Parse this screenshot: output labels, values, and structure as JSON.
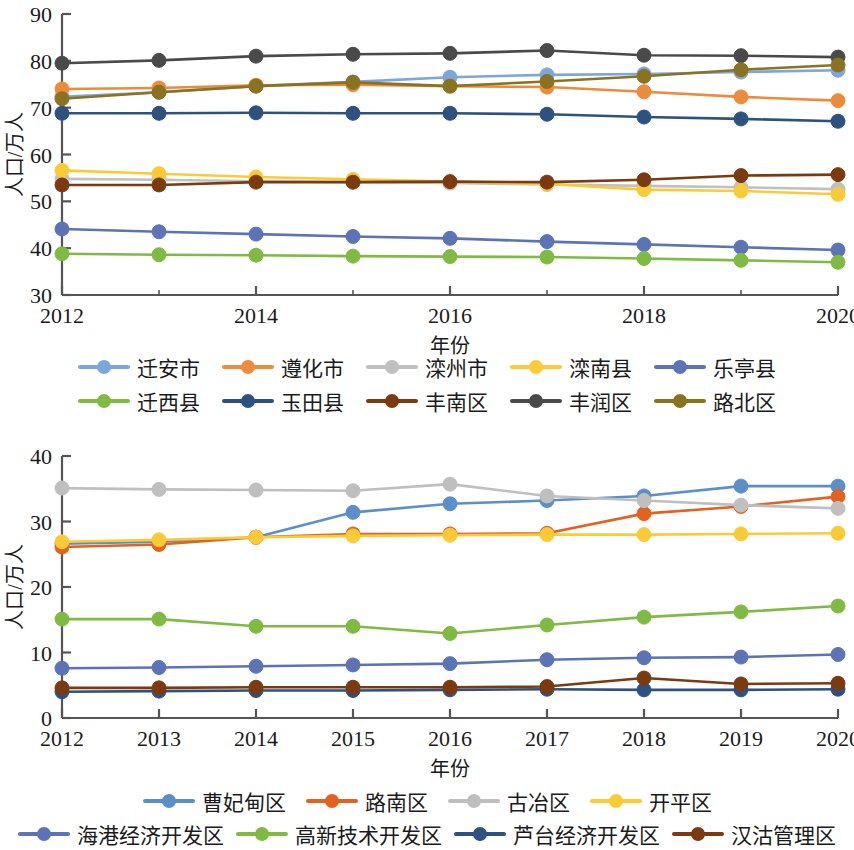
{
  "axis_common": {
    "ylabel": "人口/万人",
    "xlabel": "年份"
  },
  "chart_data": [
    {
      "id": "top",
      "type": "line",
      "title": "",
      "xlabel": "年份",
      "ylabel": "人口/万人",
      "x": [
        2012,
        2013,
        2014,
        2015,
        2016,
        2017,
        2018,
        2019,
        2020
      ],
      "xtick_labels": [
        "2012",
        "2014",
        "2016",
        "2018",
        "2020"
      ],
      "xtick_values": [
        2012,
        2014,
        2016,
        2018,
        2020
      ],
      "ytick_labels": [
        "30",
        "40",
        "50",
        "60",
        "70",
        "80",
        "90"
      ],
      "ylim": [
        30,
        90
      ],
      "xlim": [
        2012,
        2020
      ],
      "grid": false,
      "legend_position": "below",
      "series": [
        {
          "name": "迁安市",
          "color": "#7BA7DC",
          "values": [
            72.3,
            73.3,
            74.6,
            75.5,
            76.5,
            77.0,
            77.2,
            77.6,
            78.0
          ]
        },
        {
          "name": "遵化市",
          "color": "#ED8B3C",
          "values": [
            74.0,
            74.2,
            74.8,
            74.9,
            74.6,
            74.4,
            73.4,
            72.3,
            71.5
          ]
        },
        {
          "name": "滦州市",
          "color": "#C0C0C0",
          "values": [
            54.8,
            54.6,
            54.3,
            54.1,
            53.9,
            53.6,
            53.3,
            53.0,
            52.6
          ]
        },
        {
          "name": "滦南县",
          "color": "#FBCB37",
          "values": [
            56.6,
            55.9,
            55.2,
            54.7,
            54.2,
            53.7,
            52.5,
            52.2,
            51.5
          ]
        },
        {
          "name": "乐亭县",
          "color": "#5C74B5",
          "values": [
            44.1,
            43.5,
            43.0,
            42.5,
            42.1,
            41.4,
            40.8,
            40.2,
            39.6
          ]
        },
        {
          "name": "迁西县",
          "color": "#7FBB42",
          "values": [
            38.8,
            38.6,
            38.5,
            38.3,
            38.2,
            38.1,
            37.8,
            37.4,
            37.0
          ]
        },
        {
          "name": "玉田县",
          "color": "#2E5280",
          "values": [
            68.8,
            68.8,
            68.9,
            68.8,
            68.8,
            68.6,
            68.0,
            67.6,
            67.1
          ]
        },
        {
          "name": "丰南区",
          "color": "#7B3A10",
          "values": [
            53.5,
            53.5,
            54.1,
            54.1,
            54.2,
            54.1,
            54.6,
            55.5,
            55.7
          ]
        },
        {
          "name": "丰润区",
          "color": "#4A4A4A",
          "values": [
            79.5,
            80.1,
            81.0,
            81.4,
            81.6,
            82.2,
            81.2,
            81.1,
            80.8
          ]
        },
        {
          "name": "路北区",
          "color": "#8A7320",
          "values": [
            71.9,
            73.3,
            74.6,
            75.4,
            74.6,
            75.6,
            76.7,
            78.1,
            79.1
          ]
        }
      ]
    },
    {
      "id": "bottom",
      "type": "line",
      "title": "",
      "xlabel": "年份",
      "ylabel": "人口/万人",
      "x": [
        2012,
        2013,
        2014,
        2015,
        2016,
        2017,
        2018,
        2019,
        2020
      ],
      "xtick_labels": [
        "2012",
        "2013",
        "2014",
        "2015",
        "2016",
        "2017",
        "2018",
        "2019",
        "2020"
      ],
      "xtick_values": [
        2012,
        2013,
        2014,
        2015,
        2016,
        2017,
        2018,
        2019,
        2020
      ],
      "ytick_labels": [
        "0",
        "10",
        "20",
        "30",
        "40"
      ],
      "ylim": [
        0,
        40
      ],
      "xlim": [
        2012,
        2020
      ],
      "grid": false,
      "legend_position": "below",
      "series": [
        {
          "name": "曹妃甸区",
          "color": "#5B8FC9",
          "values": [
            26.6,
            26.9,
            27.6,
            31.4,
            32.7,
            33.2,
            33.9,
            35.4,
            35.4
          ]
        },
        {
          "name": "路南区",
          "color": "#E2621F",
          "values": [
            26.1,
            26.5,
            27.6,
            28.1,
            28.1,
            28.2,
            31.2,
            32.3,
            33.8
          ]
        },
        {
          "name": "古冶区",
          "color": "#BFBFBF",
          "values": [
            35.1,
            34.9,
            34.8,
            34.7,
            35.7,
            33.9,
            33.2,
            32.5,
            32.0
          ]
        },
        {
          "name": "开平区",
          "color": "#FBCB37",
          "values": [
            26.9,
            27.2,
            27.6,
            27.8,
            27.9,
            28.0,
            28.0,
            28.1,
            28.2
          ]
        },
        {
          "name": "海港经济开发区",
          "color": "#5C74B5",
          "values": [
            7.6,
            7.7,
            7.9,
            8.1,
            8.3,
            8.9,
            9.2,
            9.3,
            9.7
          ]
        },
        {
          "name": "高新技术开发区",
          "color": "#7FBB42",
          "values": [
            15.1,
            15.1,
            14.0,
            14.0,
            12.9,
            14.2,
            15.4,
            16.2,
            17.1
          ]
        },
        {
          "name": "芦台经济开发区",
          "color": "#2E5280",
          "values": [
            4.0,
            4.1,
            4.2,
            4.2,
            4.3,
            4.4,
            4.3,
            4.3,
            4.4
          ]
        },
        {
          "name": "汉沽管理区",
          "color": "#7B3A10",
          "values": [
            4.6,
            4.6,
            4.7,
            4.7,
            4.7,
            4.8,
            6.1,
            5.2,
            5.3
          ]
        }
      ]
    }
  ],
  "legends": {
    "top": {
      "rows": [
        [
          {
            "label": "迁安市",
            "color": "#7BA7DC"
          },
          {
            "label": "遵化市",
            "color": "#ED8B3C"
          },
          {
            "label": "滦州市",
            "color": "#C0C0C0"
          },
          {
            "label": "滦南县",
            "color": "#FBCB37"
          },
          {
            "label": "乐亭县",
            "color": "#5C74B5"
          }
        ],
        [
          {
            "label": "迁西县",
            "color": "#7FBB42"
          },
          {
            "label": "玉田县",
            "color": "#2E5280"
          },
          {
            "label": "丰南区",
            "color": "#7B3A10"
          },
          {
            "label": "丰润区",
            "color": "#4A4A4A"
          },
          {
            "label": "路北区",
            "color": "#8A7320"
          }
        ]
      ]
    },
    "bottom": {
      "rows": [
        [
          {
            "label": "曹妃甸区",
            "color": "#5B8FC9"
          },
          {
            "label": "路南区",
            "color": "#E2621F"
          },
          {
            "label": "古冶区",
            "color": "#BFBFBF"
          },
          {
            "label": "开平区",
            "color": "#FBCB37"
          }
        ],
        [
          {
            "label": "海港经济开发区",
            "color": "#5C74B5"
          },
          {
            "label": "高新技术开发区",
            "color": "#7FBB42"
          },
          {
            "label": "芦台经济开发区",
            "color": "#2E5280"
          },
          {
            "label": "汉沽管理区",
            "color": "#7B3A10"
          }
        ]
      ]
    }
  }
}
